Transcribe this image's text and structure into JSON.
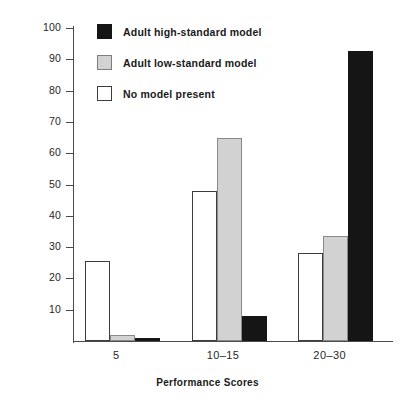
{
  "chart_data": {
    "type": "bar",
    "title": "",
    "xlabel": "Performance Scores",
    "ylabel": "Percent of Self-Reinforcement",
    "categories": [
      "5",
      "10–15",
      "20–30"
    ],
    "ylim": [
      0,
      100
    ],
    "yticks": [
      10,
      20,
      30,
      40,
      50,
      60,
      70,
      80,
      90,
      100
    ],
    "ytick_labels": [
      "10",
      "20",
      "30",
      "40",
      "50",
      "60",
      "70",
      "80",
      "90",
      "100"
    ],
    "grid": false,
    "legend_position": "upper-left-inside",
    "series": [
      {
        "name": "No model present",
        "color": "#ffffff",
        "edge_color": "#3d3d3d",
        "values": [
          25.5,
          48,
          28
        ]
      },
      {
        "name": "Adult low-standard model",
        "color": "#d2d2d2",
        "edge_color": "#8a8a8a",
        "values": [
          2,
          65,
          33.5
        ]
      },
      {
        "name": "Adult high-standard model",
        "color": "#151515",
        "edge_color": "#151515",
        "values": [
          1,
          8,
          92.5
        ]
      }
    ],
    "legend_order": [
      "Adult high-standard model",
      "Adult low-standard model",
      "No model present"
    ]
  },
  "legend": {
    "items": [
      {
        "label": "Adult high-standard model",
        "swatch": "black"
      },
      {
        "label": "Adult low-standard model",
        "swatch": "gray"
      },
      {
        "label": "No model present",
        "swatch": "white"
      }
    ]
  },
  "axes": {
    "x_title": "Performance Scores",
    "y_title": "Percent of Self-Reinforcement"
  }
}
